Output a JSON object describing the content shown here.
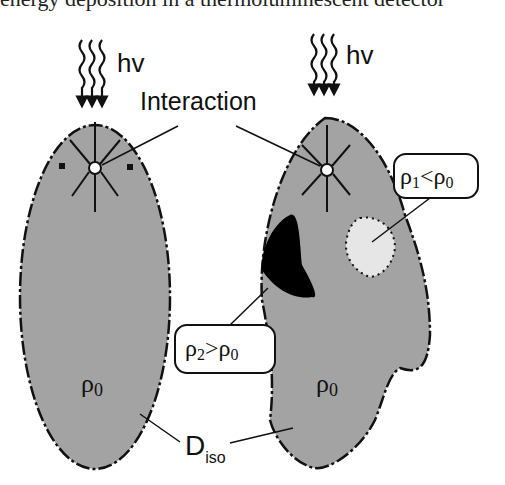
{
  "cropped_caption": "energy deposition in a thermoluminescent detector",
  "photon_label": "hv",
  "interaction_label": "Interaction",
  "rho0_left": "ρ0",
  "rho0_right": "ρ0",
  "rho1_box": {
    "rho": "ρ",
    "sub1": "1",
    "op": "<",
    "rho2": "ρ",
    "sub2": "0"
  },
  "rho2_box": {
    "rho": "ρ",
    "sub1": "2",
    "op": ">",
    "rho2": "ρ",
    "sub2": "0"
  },
  "diso_label": {
    "main": "D",
    "sub": "iso"
  },
  "colors": {
    "body_fill": "#a3a3a3",
    "dense_region": "#000000",
    "light_region": "#e6e6e6",
    "outline": "#111111"
  }
}
